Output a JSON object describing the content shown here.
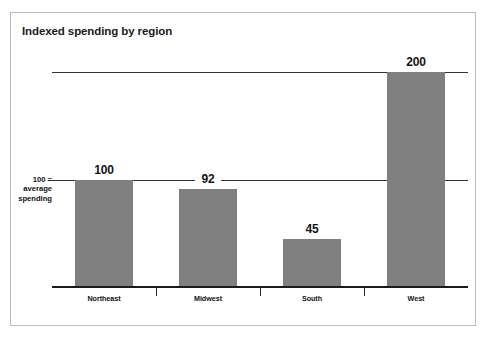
{
  "figure": {
    "title": "Indexed spending by region",
    "background_color": "#ffffff",
    "frame_color": "#b9bcc0"
  },
  "axis_annotation": {
    "line1": "100 =",
    "line2": "average",
    "line3": "spending"
  },
  "chart_data": {
    "type": "bar",
    "title": "Indexed spending by region",
    "xlabel": "",
    "ylabel": "",
    "categories": [
      "Northeast",
      "Midwest",
      "South",
      "West"
    ],
    "values": [
      100,
      92,
      45,
      200
    ],
    "value_labels": [
      "100",
      "92",
      "45",
      "200"
    ],
    "ylim": [
      0,
      222
    ],
    "gridlines": [
      100,
      200
    ],
    "grid": true,
    "legend": null,
    "bar_color": "#808080",
    "annotations": [
      {
        "text": "100 = average spending",
        "value": 100,
        "position": "y-axis-left"
      }
    ]
  }
}
